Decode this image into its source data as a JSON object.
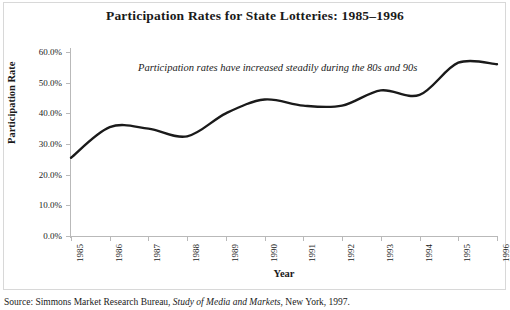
{
  "chart_data": {
    "type": "line",
    "title": "Participation Rates for State Lotteries: 1985–1996",
    "xlabel": "Year",
    "ylabel": "Participation Rate",
    "categories": [
      "1985",
      "1986",
      "1987",
      "1988",
      "1989",
      "1990",
      "1991",
      "1992",
      "1993",
      "1994",
      "1995",
      "1996"
    ],
    "values": [
      25.5,
      35.5,
      35.0,
      32.5,
      40.0,
      44.5,
      42.5,
      42.5,
      47.5,
      46.0,
      56.5,
      56.0
    ],
    "series": [
      {
        "name": "Participation Rate",
        "values": [
          25.5,
          35.5,
          35.0,
          32.5,
          40.0,
          44.5,
          42.5,
          42.5,
          47.5,
          46.0,
          56.5,
          56.0
        ]
      }
    ],
    "ylim": [
      0,
      60
    ],
    "ytick_labels": [
      "0.0%",
      "10.0%",
      "20.0%",
      "30.0%",
      "40.0%",
      "50.0%",
      "60.0%"
    ],
    "ytick_values": [
      0,
      10,
      20,
      30,
      40,
      50,
      60
    ],
    "grid": false,
    "legend": "none",
    "smoothing": "spline",
    "line_color": "#1a1a1a",
    "annotations": [
      {
        "text": "Participation rates have increased steadily during the 80s and 90s",
        "style": "italic"
      }
    ]
  },
  "source": {
    "prefix": "Source: Simmons Market Research Bureau,",
    "italic_title": "Study of Media and Markets",
    "suffix": ", New York, 1997."
  }
}
